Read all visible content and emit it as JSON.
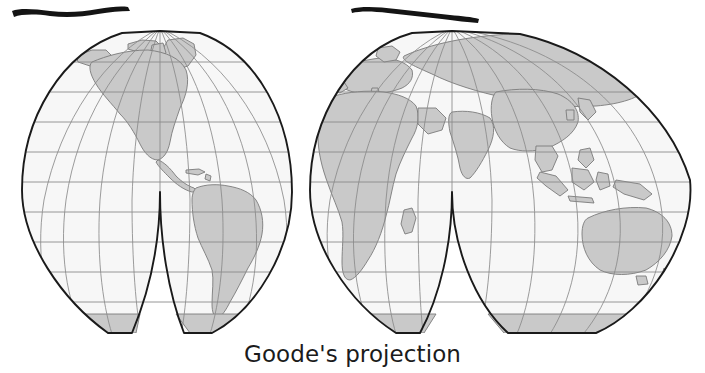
{
  "figure": {
    "caption": "Goode's projection",
    "map_type": "Goode's homolosine interrupted world map",
    "colors": {
      "land_fill": "#c9c9c9",
      "ocean_fill": "#f7f7f7",
      "graticule": "#8a8a8a",
      "outline": "#1a1a1a",
      "coastline": "#777777",
      "annotation_stroke": "#141414",
      "caption_text": "#1b1b1b",
      "background": "#ffffff"
    },
    "graticule": {
      "parallel_interval_deg": 20,
      "meridian_interval_deg": 20,
      "equator_y": 182,
      "north_pole_y": 31,
      "south_pole_y": 333
    },
    "lobes": [
      {
        "name": "lobe-north-america",
        "central_meridian_deg": -100,
        "hemisphere": "west"
      },
      {
        "name": "lobe-south-america",
        "central_meridian_deg": -60,
        "hemisphere": "west"
      },
      {
        "name": "lobe-europe-africa",
        "central_meridian_deg": 20,
        "hemisphere": "east"
      },
      {
        "name": "lobe-asia-australia",
        "central_meridian_deg": 120,
        "hemisphere": "east"
      }
    ],
    "landmasses": [
      "North America",
      "Greenland",
      "South America",
      "Europe",
      "Africa",
      "Asia",
      "Australia",
      "Antarctica",
      "Madagascar",
      "New Guinea"
    ],
    "annotations": [
      {
        "name": "marker-stroke-left",
        "kind": "hand-drawn-horizontal-line",
        "x": 12,
        "y": 9,
        "width": 118
      },
      {
        "name": "marker-stroke-right",
        "kind": "hand-drawn-horizontal-line",
        "x": 351,
        "y": 7,
        "width": 128
      }
    ]
  }
}
